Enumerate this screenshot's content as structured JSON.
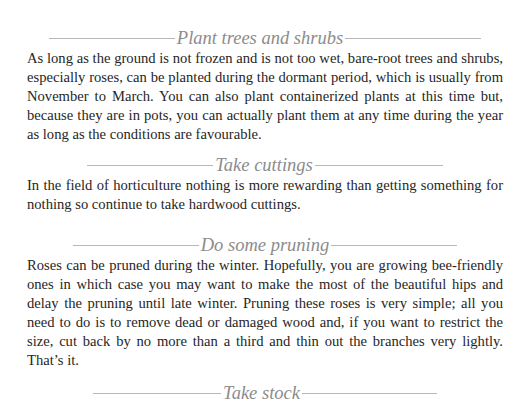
{
  "sections": [
    {
      "heading": "Plant trees and shrubs",
      "body": "As long as the ground is not frozen and is not too wet, bare-root trees and shrubs, especially roses, can be planted during the dormant period, which is usually from November to March. You can also plant containerized plants at this time but, because they are in pots, you can actually plant them at any time during the year as long as the conditions are favourable."
    },
    {
      "heading": "Take cuttings",
      "body": "In the field of horticulture nothing is more rewarding than getting something for nothing so continue to take hardwood cuttings."
    },
    {
      "heading": "Do some pruning",
      "body": "Roses can be pruned during the winter. Hopefully, you are growing bee-friendly ones in which case you may want to make the most of the beautiful hips and delay the pruning until late winter. Pruning these roses is very simple; all you need to do is to remove dead or damaged wood and, if you want to restrict the size, cut back by no more than a third and thin out the branches very lightly. That’s it."
    },
    {
      "heading": "Take stock",
      "body": ""
    }
  ],
  "colors": {
    "heading_text": "#8c8c8c",
    "rule": "#b8b8b8",
    "body_text": "#262626",
    "background": "#ffffff"
  }
}
